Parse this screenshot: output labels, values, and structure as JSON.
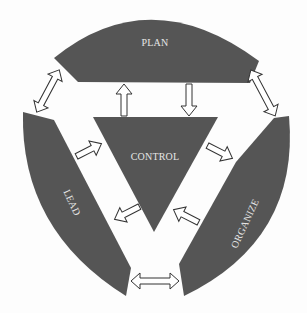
{
  "diagram": {
    "colors": {
      "shape": "#555555",
      "label": "#e6e6e6",
      "arrow_fill": "#ffffff",
      "arrow_stroke": "#333333",
      "background": "#fdfdfd"
    },
    "nodes": [
      {
        "id": "plan",
        "label": "PLAN"
      },
      {
        "id": "organize",
        "label": "ORGANIZE"
      },
      {
        "id": "lead",
        "label": "LEAD"
      },
      {
        "id": "control",
        "label": "CONTROL"
      }
    ],
    "edges": [
      {
        "from": "plan",
        "to": "lead",
        "type": "bidirectional"
      },
      {
        "from": "plan",
        "to": "organize",
        "type": "bidirectional"
      },
      {
        "from": "lead",
        "to": "organize",
        "type": "bidirectional"
      },
      {
        "from": "control",
        "to": "plan",
        "type": "directed"
      },
      {
        "from": "plan",
        "to": "control",
        "type": "directed"
      },
      {
        "from": "control",
        "to": "organize",
        "type": "directed"
      },
      {
        "from": "organize",
        "to": "control",
        "type": "directed"
      },
      {
        "from": "control",
        "to": "lead",
        "type": "directed"
      },
      {
        "from": "lead",
        "to": "control",
        "type": "directed"
      }
    ]
  }
}
